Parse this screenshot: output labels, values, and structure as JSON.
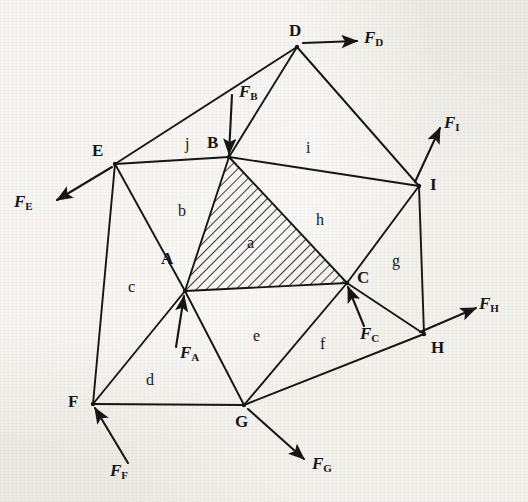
{
  "figure": {
    "kind": "truss-force-diagram",
    "width": 528,
    "height": 502,
    "background_color": "#edeae3",
    "line_color": "#141414"
  },
  "nodes": [
    {
      "id": "A",
      "label": "A",
      "x": 185,
      "y": 291,
      "label_x": 161,
      "label_y": 250
    },
    {
      "id": "B",
      "label": "B",
      "x": 229,
      "y": 157,
      "label_x": 207,
      "label_y": 134
    },
    {
      "id": "C",
      "label": "C",
      "x": 347,
      "y": 283,
      "label_x": 357,
      "label_y": 269
    },
    {
      "id": "D",
      "label": "D",
      "x": 297,
      "y": 47,
      "label_x": 289,
      "label_y": 22
    },
    {
      "id": "E",
      "label": "E",
      "x": 115,
      "y": 164,
      "label_x": 92,
      "label_y": 142
    },
    {
      "id": "F",
      "label": "F",
      "x": 93,
      "y": 404,
      "label_x": 68,
      "label_y": 393
    },
    {
      "id": "G",
      "label": "G",
      "x": 244,
      "y": 405,
      "label_x": 235,
      "label_y": 413
    },
    {
      "id": "H",
      "label": "H",
      "x": 424,
      "y": 334,
      "label_x": 431,
      "label_y": 339
    },
    {
      "id": "I",
      "label": "I",
      "x": 419,
      "y": 186,
      "label_x": 430,
      "label_y": 176
    }
  ],
  "members": [
    {
      "from": "E",
      "to": "B"
    },
    {
      "from": "B",
      "to": "D"
    },
    {
      "from": "D",
      "to": "I"
    },
    {
      "from": "B",
      "to": "I"
    },
    {
      "from": "B",
      "to": "A"
    },
    {
      "from": "B",
      "to": "C"
    },
    {
      "from": "A",
      "to": "C"
    },
    {
      "from": "A",
      "to": "E"
    },
    {
      "from": "E",
      "to": "F"
    },
    {
      "from": "A",
      "to": "F"
    },
    {
      "from": "A",
      "to": "G"
    },
    {
      "from": "F",
      "to": "G"
    },
    {
      "from": "G",
      "to": "C"
    },
    {
      "from": "G",
      "to": "H"
    },
    {
      "from": "C",
      "to": "H"
    },
    {
      "from": "C",
      "to": "I"
    },
    {
      "from": "I",
      "to": "H"
    },
    {
      "from": "E",
      "to": "D"
    }
  ],
  "regions": [
    {
      "label": "a",
      "x": 247,
      "y": 235,
      "hatched": true
    },
    {
      "label": "b",
      "x": 178,
      "y": 203,
      "hatched": false
    },
    {
      "label": "c",
      "x": 128,
      "y": 279,
      "hatched": false
    },
    {
      "label": "d",
      "x": 146,
      "y": 372,
      "hatched": false
    },
    {
      "label": "e",
      "x": 253,
      "y": 328,
      "hatched": false
    },
    {
      "label": "f",
      "x": 320,
      "y": 336,
      "hatched": false
    },
    {
      "label": "g",
      "x": 392,
      "y": 253,
      "hatched": false
    },
    {
      "label": "h",
      "x": 316,
      "y": 212,
      "hatched": false
    },
    {
      "label": "i",
      "x": 306,
      "y": 140,
      "hatched": false
    },
    {
      "label": "j",
      "x": 185,
      "y": 136,
      "hatched": false
    }
  ],
  "hatched_region": {
    "label": "a",
    "vertices": [
      "B",
      "A",
      "C"
    ],
    "hatch_angle_deg": 45,
    "hatch_spacing_px": 6
  },
  "forces": [
    {
      "id": "FD",
      "symbol": "F",
      "subscript": "D",
      "node": "D",
      "tail_x": 303,
      "tail_y": 43,
      "tip_x": 357,
      "tip_y": 41,
      "label_x": 364,
      "label_y": 29
    },
    {
      "id": "FI",
      "symbol": "F",
      "subscript": "I",
      "node": "I",
      "tail_x": 415,
      "tail_y": 182,
      "tip_x": 440,
      "tip_y": 128,
      "label_x": 444,
      "label_y": 114
    },
    {
      "id": "FH",
      "symbol": "F",
      "subscript": "H",
      "node": "H",
      "tail_x": 420,
      "tail_y": 332,
      "tip_x": 476,
      "tip_y": 308,
      "label_x": 479,
      "label_y": 295
    },
    {
      "id": "FB",
      "symbol": "F",
      "subscript": "B",
      "node": "B",
      "tail_x": 232,
      "tail_y": 95,
      "tip_x": 229,
      "tip_y": 154,
      "label_x": 239,
      "label_y": 83
    },
    {
      "id": "FA",
      "symbol": "F",
      "subscript": "A",
      "node": "A",
      "tail_x": 176,
      "tail_y": 347,
      "tip_x": 184,
      "tip_y": 296,
      "label_x": 180,
      "label_y": 344
    },
    {
      "id": "FC",
      "symbol": "F",
      "subscript": "C",
      "node": "C",
      "tail_x": 364,
      "tail_y": 326,
      "tip_x": 348,
      "tip_y": 287,
      "label_x": 360,
      "label_y": 325
    },
    {
      "id": "FE",
      "symbol": "F",
      "subscript": "E",
      "node": "E",
      "tail_x": 112,
      "tail_y": 167,
      "tip_x": 57,
      "tip_y": 200,
      "label_x": 14,
      "label_y": 193
    },
    {
      "id": "FF",
      "symbol": "F",
      "subscript": "F",
      "node": "F",
      "tail_x": 128,
      "tail_y": 463,
      "tip_x": 95,
      "tip_y": 408,
      "label_x": 110,
      "label_y": 462
    },
    {
      "id": "FG",
      "symbol": "F",
      "subscript": "G",
      "node": "G",
      "tail_x": 248,
      "tail_y": 409,
      "tip_x": 304,
      "tip_y": 459,
      "label_x": 312,
      "label_y": 455
    }
  ]
}
